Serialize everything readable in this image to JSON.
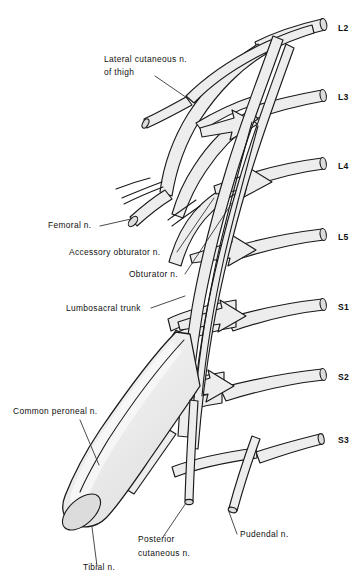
{
  "figure": {
    "background_color": "#ffffff",
    "line_color": "#1a1a1a",
    "nerve_fill_color": "#ededed",
    "nerve_fill_highlight": "#f7f7f7",
    "cap_color": "#dcdcdc"
  },
  "roots": [
    {
      "id": "L2",
      "label": "L2",
      "x": 338,
      "y": 31
    },
    {
      "id": "L3",
      "label": "L3",
      "x": 338,
      "y": 100
    },
    {
      "id": "L4",
      "label": "L4",
      "x": 338,
      "y": 169
    },
    {
      "id": "L5",
      "label": "L5",
      "x": 338,
      "y": 240
    },
    {
      "id": "S1",
      "label": "S1",
      "x": 338,
      "y": 310
    },
    {
      "id": "S2",
      "label": "S2",
      "x": 338,
      "y": 380
    },
    {
      "id": "S3",
      "label": "S3",
      "x": 338,
      "y": 443
    }
  ],
  "labels": [
    {
      "id": "lateral-cutaneous-of-thigh",
      "lines": [
        "Lateral cutaneous n.",
        "of thigh"
      ],
      "x": 104,
      "y": 62,
      "anchor": "start"
    },
    {
      "id": "femoral",
      "lines": [
        "Femoral n."
      ],
      "x": 48,
      "y": 228,
      "anchor": "start"
    },
    {
      "id": "accessory-obturator",
      "lines": [
        "Accessory obturator n."
      ],
      "x": 69,
      "y": 255,
      "anchor": "start"
    },
    {
      "id": "obturator",
      "lines": [
        "Obturator n."
      ],
      "x": 129,
      "y": 277,
      "anchor": "start"
    },
    {
      "id": "lumbosacral-trunk",
      "lines": [
        "Lumbosacral trunk"
      ],
      "x": 66,
      "y": 311,
      "anchor": "start"
    },
    {
      "id": "common-peroneal",
      "lines": [
        "Common peroneal n."
      ],
      "x": 13,
      "y": 414,
      "anchor": "start"
    },
    {
      "id": "posterior-cutaneous",
      "lines": [
        "Posterior",
        "cutaneous n."
      ],
      "x": 138,
      "y": 542,
      "anchor": "start"
    },
    {
      "id": "tibial",
      "lines": [
        "Tibial n."
      ],
      "x": 83,
      "y": 570,
      "anchor": "start"
    },
    {
      "id": "pudendal",
      "lines": [
        "Pudendal n."
      ],
      "x": 240,
      "y": 537,
      "anchor": "start"
    }
  ]
}
